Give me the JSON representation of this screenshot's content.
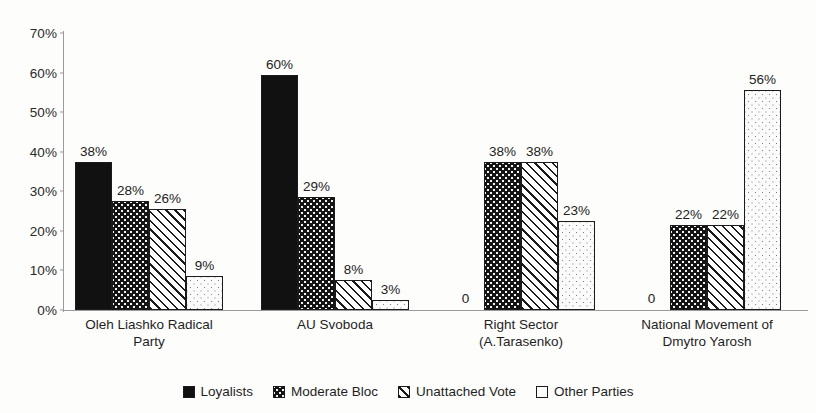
{
  "chart_data": {
    "type": "bar",
    "title": "",
    "subtitle": "",
    "xlabel": "",
    "ylabel": "",
    "ylim": [
      0,
      70
    ],
    "ytick_labels": [
      "0%",
      "10%",
      "20%",
      "30%",
      "40%",
      "50%",
      "60%",
      "70%"
    ],
    "ytick_values": [
      0,
      10,
      20,
      30,
      40,
      50,
      60,
      70
    ],
    "grid": false,
    "legend_position": "bottom",
    "categories": [
      "Oleh Liashko Radical Party",
      "AU Svoboda",
      "Right Sector (A.Tarasenko)",
      "National Movement of Dmytro Yarosh"
    ],
    "category_lines": [
      [
        "Oleh Liashko Radical",
        "Party"
      ],
      [
        "AU Svoboda"
      ],
      [
        "Right Sector",
        "(A.Tarasenko)"
      ],
      [
        "National Movement of",
        "Dmytro Yarosh"
      ]
    ],
    "series": [
      {
        "name": "Loyalists",
        "pattern": "solid-black",
        "values": [
          38,
          60,
          0,
          0
        ],
        "labels": [
          "38%",
          "60%",
          "0",
          "0"
        ]
      },
      {
        "name": "Moderate Bloc",
        "pattern": "dense-dots-on-black",
        "values": [
          28,
          29,
          38,
          22
        ],
        "labels": [
          "28%",
          "29%",
          "38%",
          "22%"
        ]
      },
      {
        "name": "Unattached Vote",
        "pattern": "diagonal-hatch",
        "values": [
          26,
          8,
          38,
          22
        ],
        "labels": [
          "26%",
          "8%",
          "38%",
          "22%"
        ]
      },
      {
        "name": "Other Parties",
        "pattern": "sparse-dots-light",
        "values": [
          9,
          3,
          23,
          56
        ],
        "labels": [
          "9%",
          "3%",
          "23%",
          "56%"
        ]
      }
    ]
  },
  "legend": {
    "items": [
      {
        "label": "Loyalists",
        "swatch": "solid-black-swatch"
      },
      {
        "label": "Moderate Bloc",
        "swatch": "dense-dots-swatch"
      },
      {
        "label": "Unattached Vote",
        "swatch": "diagonal-hatch-swatch"
      },
      {
        "label": "Other Parties",
        "swatch": "empty-white-swatch"
      }
    ]
  },
  "colors": {
    "bar_outline": "#1b1b1b",
    "solid_fill": "#111111",
    "axis": "#9a9a9a",
    "text": "#1f1f1f",
    "background": "#fdfdfc"
  }
}
